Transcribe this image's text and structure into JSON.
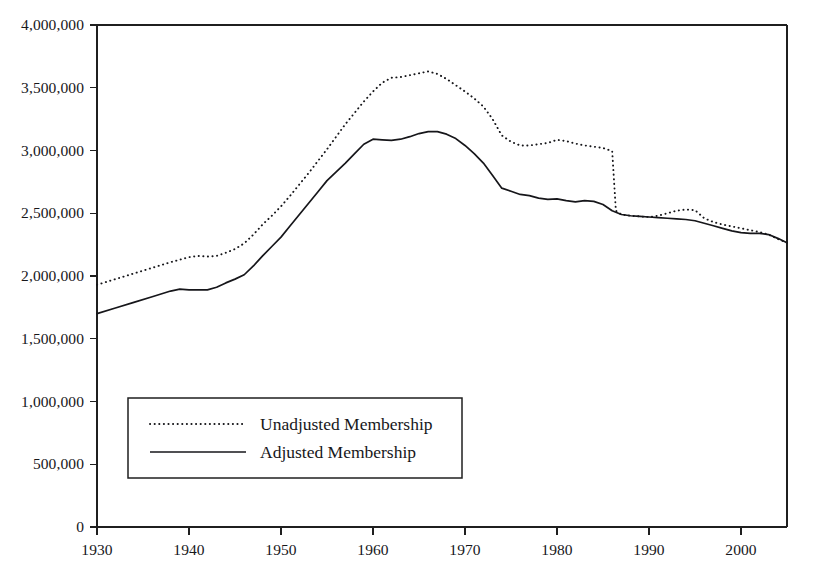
{
  "chart_data": {
    "type": "line",
    "title": "",
    "subtitle": "",
    "xlabel": "",
    "ylabel": "",
    "xlim": [
      1930,
      2005
    ],
    "ylim": [
      0,
      4000000
    ],
    "grid": false,
    "legend_position": "inside-lower-left",
    "y_ticks": [
      {
        "value": 0,
        "label": "0"
      },
      {
        "value": 500000,
        "label": "500,000"
      },
      {
        "value": 1000000,
        "label": "1,000,000"
      },
      {
        "value": 1500000,
        "label": "1,500,000"
      },
      {
        "value": 2000000,
        "label": "2,000,000"
      },
      {
        "value": 2500000,
        "label": "2,500,000"
      },
      {
        "value": 3000000,
        "label": "3,000,000"
      },
      {
        "value": 3500000,
        "label": "3,500,000"
      },
      {
        "value": 4000000,
        "label": "4,000,000"
      }
    ],
    "x_ticks": [
      {
        "value": 1930,
        "label": "1930"
      },
      {
        "value": 1940,
        "label": "1940"
      },
      {
        "value": 1950,
        "label": "1950"
      },
      {
        "value": 1960,
        "label": "1960"
      },
      {
        "value": 1970,
        "label": "1970"
      },
      {
        "value": 1980,
        "label": "1980"
      },
      {
        "value": 1990,
        "label": "1990"
      },
      {
        "value": 2000,
        "label": "2000"
      }
    ],
    "legend": [
      {
        "label": "Unadjusted Membership",
        "style": "dotted"
      },
      {
        "label": "Adjusted Membership",
        "style": "solid"
      }
    ],
    "series": [
      {
        "name": "Unadjusted Membership",
        "style": "dotted",
        "x": [
          1930,
          1932,
          1934,
          1936,
          1938,
          1940,
          1941,
          1942,
          1943,
          1944,
          1945,
          1946,
          1947,
          1948,
          1949,
          1950,
          1951,
          1952,
          1953,
          1954,
          1955,
          1956,
          1957,
          1958,
          1959,
          1960,
          1961,
          1962,
          1963,
          1964,
          1965,
          1966,
          1967,
          1968,
          1969,
          1970,
          1971,
          1972,
          1973,
          1974,
          1975,
          1976,
          1977,
          1978,
          1979,
          1980,
          1981,
          1982,
          1983,
          1984,
          1985,
          1986,
          1986.4,
          1987,
          1988,
          1989,
          1990,
          1991,
          1992,
          1993,
          1994,
          1995,
          1996,
          1997,
          1998,
          1999,
          2000,
          2001,
          2002,
          2003,
          2004,
          2005
        ],
        "y": [
          1930000,
          1975000,
          2020000,
          2065000,
          2110000,
          2150000,
          2160000,
          2155000,
          2160000,
          2185000,
          2215000,
          2260000,
          2330000,
          2410000,
          2480000,
          2555000,
          2640000,
          2730000,
          2820000,
          2915000,
          3010000,
          3110000,
          3210000,
          3300000,
          3390000,
          3470000,
          3540000,
          3580000,
          3585000,
          3600000,
          3615000,
          3630000,
          3610000,
          3570000,
          3520000,
          3470000,
          3415000,
          3350000,
          3250000,
          3120000,
          3070000,
          3040000,
          3040000,
          3050000,
          3060000,
          3085000,
          3075000,
          3055000,
          3040000,
          3030000,
          3020000,
          2995000,
          2520000,
          2490000,
          2480000,
          2475000,
          2470000,
          2480000,
          2500000,
          2520000,
          2530000,
          2525000,
          2460000,
          2430000,
          2410000,
          2395000,
          2380000,
          2365000,
          2350000,
          2330000,
          2295000,
          2265000
        ]
      },
      {
        "name": "Adjusted Membership",
        "style": "solid",
        "x": [
          1930,
          1932,
          1934,
          1936,
          1938,
          1939,
          1940,
          1941,
          1942,
          1943,
          1944,
          1945,
          1946,
          1947,
          1948,
          1949,
          1950,
          1951,
          1952,
          1953,
          1954,
          1955,
          1956,
          1957,
          1958,
          1959,
          1960,
          1961,
          1962,
          1963,
          1964,
          1965,
          1966,
          1967,
          1968,
          1969,
          1970,
          1971,
          1972,
          1973,
          1974,
          1975,
          1976,
          1977,
          1978,
          1979,
          1980,
          1981,
          1982,
          1983,
          1984,
          1985,
          1986,
          1987,
          1988,
          1989,
          1990,
          1991,
          1992,
          1993,
          1994,
          1995,
          1996,
          1997,
          1998,
          1999,
          2000,
          2001,
          2002,
          2003,
          2004,
          2005
        ],
        "y": [
          1700000,
          1745000,
          1790000,
          1835000,
          1880000,
          1895000,
          1890000,
          1890000,
          1890000,
          1910000,
          1945000,
          1975000,
          2010000,
          2080000,
          2160000,
          2235000,
          2310000,
          2400000,
          2490000,
          2580000,
          2670000,
          2760000,
          2830000,
          2900000,
          2975000,
          3050000,
          3090000,
          3085000,
          3080000,
          3090000,
          3110000,
          3135000,
          3150000,
          3150000,
          3130000,
          3095000,
          3040000,
          2975000,
          2900000,
          2800000,
          2700000,
          2675000,
          2650000,
          2640000,
          2620000,
          2610000,
          2615000,
          2600000,
          2590000,
          2600000,
          2595000,
          2570000,
          2520000,
          2490000,
          2480000,
          2475000,
          2470000,
          2465000,
          2460000,
          2455000,
          2450000,
          2440000,
          2420000,
          2400000,
          2380000,
          2360000,
          2345000,
          2340000,
          2340000,
          2330000,
          2300000,
          2265000
        ]
      }
    ]
  },
  "figure": {
    "plot_area": {
      "left": 97,
      "top": 25,
      "right": 787,
      "bottom": 527
    },
    "legend_box": {
      "left": 128,
      "top": 398,
      "right": 462,
      "bottom": 478
    }
  }
}
